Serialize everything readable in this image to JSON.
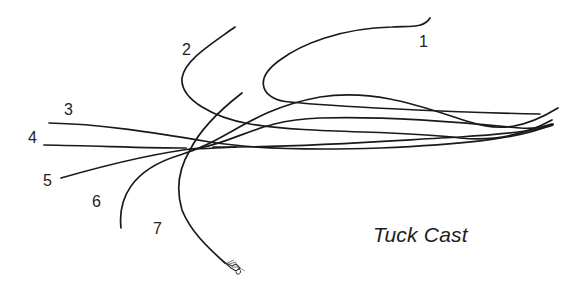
{
  "diagram": {
    "title": "Tuck Cast",
    "stroke_color": "#1a1a1a",
    "background_color": "#ffffff",
    "stages": [
      {
        "label": "1",
        "x": 419,
        "y": 34
      },
      {
        "label": "2",
        "x": 182,
        "y": 42
      },
      {
        "label": "3",
        "x": 64,
        "y": 102
      },
      {
        "label": "4",
        "x": 28,
        "y": 130
      },
      {
        "label": "5",
        "x": 43,
        "y": 173
      },
      {
        "label": "6",
        "x": 92,
        "y": 194
      },
      {
        "label": "7",
        "x": 153,
        "y": 221
      }
    ],
    "fly": {
      "icon": "fly-icon"
    }
  }
}
